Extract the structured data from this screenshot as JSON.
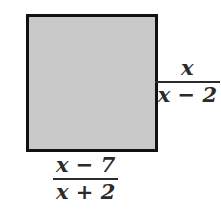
{
  "figure": {
    "type": "geometry-diagram",
    "background_color": "#ffffff",
    "shape": {
      "name": "square",
      "fill_color": "#c9c9c9",
      "border_color": "#111111",
      "border_width_px": 3,
      "x": 26,
      "y": 14,
      "width": 132,
      "height": 138
    },
    "labels": {
      "height": {
        "position": "right",
        "numerator": "x",
        "denominator": "x − 2",
        "expression": "x/(x − 2)"
      },
      "width": {
        "position": "bottom",
        "numerator": "x − 7",
        "denominator": "x + 2",
        "expression": "(x − 7)/(x + 2)"
      }
    },
    "text_color": "#2b2b2b"
  }
}
